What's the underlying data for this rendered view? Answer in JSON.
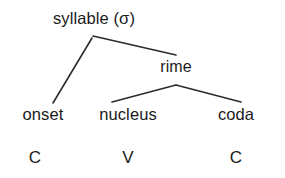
{
  "diagram": {
    "type": "tree-diagram",
    "background_color": "#ffffff",
    "line_color": "#2b2b2b",
    "text_color": "#1a1a1a",
    "nodes": {
      "root": {
        "label": "syllable (σ)",
        "x": 94,
        "y": 18
      },
      "rime": {
        "label": "rime",
        "x": 176,
        "y": 67
      },
      "onset": {
        "label": "onset",
        "x": 43,
        "y": 114
      },
      "nucleus": {
        "label": "nucleus",
        "x": 128,
        "y": 114
      },
      "coda": {
        "label": "coda",
        "x": 236,
        "y": 114
      },
      "onset_segment": {
        "label": "C",
        "x": 35,
        "y": 157
      },
      "nucleus_segment": {
        "label": "V",
        "x": 128,
        "y": 157
      },
      "coda_segment": {
        "label": "C",
        "x": 236,
        "y": 157
      }
    },
    "edges": [
      {
        "name": "root-to-onset",
        "x1": 92,
        "y1": 38,
        "x2": 53,
        "y2": 103
      },
      {
        "name": "root-to-rime",
        "x1": 93,
        "y1": 36,
        "x2": 176,
        "y2": 55
      },
      {
        "name": "rime-to-nucleus",
        "x1": 176,
        "y1": 85,
        "x2": 112,
        "y2": 102
      },
      {
        "name": "rime-to-coda",
        "x1": 176,
        "y1": 85,
        "x2": 241,
        "y2": 102
      }
    ]
  }
}
